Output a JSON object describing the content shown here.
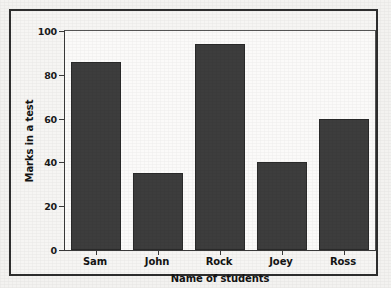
{
  "chart_data": {
    "type": "bar",
    "title": "",
    "categories": [
      "Sam",
      "John",
      "Rock",
      "Joey",
      "Ross"
    ],
    "values": [
      86,
      35,
      94,
      40,
      60
    ],
    "xlabel": "Name of students",
    "ylabel": "Marks in a test",
    "ylim": [
      0,
      100
    ],
    "yticks": [
      0,
      20,
      40,
      60,
      80,
      100
    ],
    "ytick_labels": [
      "0",
      "20",
      "40",
      "60",
      "80",
      "100"
    ],
    "grid": false,
    "legend": null,
    "bar_color": "#3d3d3d",
    "plot_background": "#fbfaf9",
    "figure_background": "#f3f2f0",
    "frame_color": "#2e2e2e"
  }
}
